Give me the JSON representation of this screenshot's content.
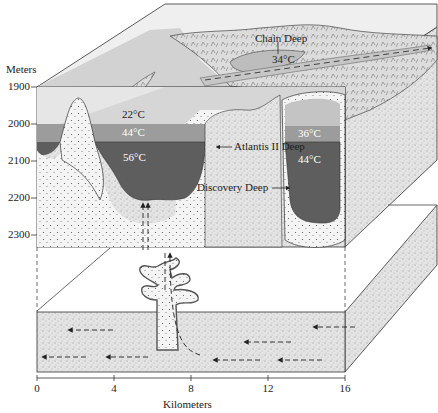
{
  "figure": {
    "type": "block diagram"
  },
  "y_axis": {
    "label": "Meters",
    "ticks": [
      "1900",
      "2000",
      "2100",
      "2200",
      "2300"
    ]
  },
  "x_axis": {
    "label": "Kilometers",
    "ticks": [
      "0",
      "4",
      "8",
      "12",
      "16"
    ]
  },
  "labels": {
    "chain_deep": "Chain Deep",
    "chain_temp": "34°C",
    "atlantis": "Atlantis II Deep",
    "discovery": "Discovery Deep",
    "atl_upper_temp": "22°C",
    "atl_mid_temp": "44°C",
    "atl_low_temp": "56°C",
    "disc_upper_temp": "36°C",
    "disc_low_temp": "44°C"
  },
  "colors": {
    "water_light": "#d9d9d9",
    "water_top": "#ececec",
    "brine_mid": "#9a9a9a",
    "brine_dark": "#5f5f5f",
    "sediment": "#e6e6e6",
    "line": "#333333"
  }
}
